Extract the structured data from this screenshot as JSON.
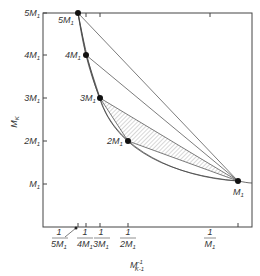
{
  "diagram": {
    "y_axis_label": {
      "main": "M",
      "sub": "K"
    },
    "x_axis_label": {
      "main": "M",
      "sup": "-1",
      "sub": "K-1"
    },
    "y_ticks": [
      {
        "coef": "5",
        "unit": "M",
        "sub": "1"
      },
      {
        "coef": "4",
        "unit": "M",
        "sub": "1"
      },
      {
        "coef": "3",
        "unit": "M",
        "sub": "1"
      },
      {
        "coef": "2",
        "unit": "M",
        "sub": "1"
      },
      {
        "coef": "",
        "unit": "M",
        "sub": "1"
      }
    ],
    "x_ticks": [
      {
        "num": "1",
        "coef": "5",
        "unit": "M",
        "sub": "1"
      },
      {
        "num": "1",
        "coef": "4",
        "unit": "M",
        "sub": "1"
      },
      {
        "num": "1",
        "coef": "3",
        "unit": "M",
        "sub": "1"
      },
      {
        "num": "1",
        "coef": "2",
        "unit": "M",
        "sub": "1"
      },
      {
        "num": "1",
        "coef": "",
        "unit": "M",
        "sub": "1"
      }
    ],
    "points": [
      {
        "coef": "5",
        "unit": "M",
        "sub": "1",
        "k": 5
      },
      {
        "coef": "4",
        "unit": "M",
        "sub": "1",
        "k": 4
      },
      {
        "coef": "3",
        "unit": "M",
        "sub": "1",
        "k": 3
      },
      {
        "coef": "2",
        "unit": "M",
        "sub": "1",
        "k": 2
      },
      {
        "coef": "",
        "unit": "M",
        "sub": "1",
        "k": 1
      }
    ],
    "hatched_region": "triangle between 3M1, 2M1 and M1",
    "colors": {
      "ink": "#333333",
      "hatch": "#9a9a9a",
      "background": "#ffffff"
    }
  }
}
